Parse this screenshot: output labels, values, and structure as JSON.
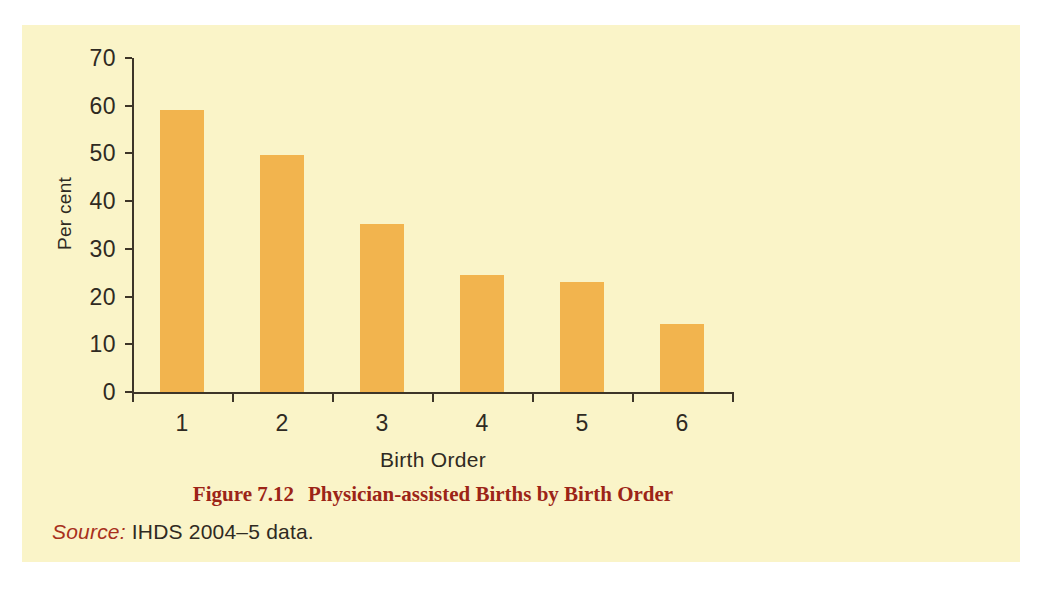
{
  "figure": {
    "caption_number": "Figure 7.12",
    "caption_title": "Physician-assisted Births by Birth Order",
    "source_label": "Source:",
    "source_text": " IHDS 2004–5 data."
  },
  "colors": {
    "panel_background": "#faf4c8",
    "bar_fill": "#f2b44e",
    "axis": "#3d3528",
    "caption": "#9c2417",
    "source_label": "#a8301c",
    "page_background": "#ffffff"
  },
  "chart_data": {
    "type": "bar",
    "title": "Physician-assisted Births by Birth Order",
    "xlabel": "Birth Order",
    "ylabel": "Per cent",
    "categories": [
      "1",
      "2",
      "3",
      "4",
      "5",
      "6"
    ],
    "values": [
      59.2,
      49.7,
      35.3,
      24.5,
      23.1,
      14.3
    ],
    "ylim": [
      0,
      70
    ],
    "yticks": [
      0,
      10,
      20,
      30,
      40,
      50,
      60,
      70
    ],
    "ytick_labels": [
      "0",
      "10",
      "20",
      "30",
      "40",
      "50",
      "60",
      "70"
    ],
    "xtick_labels": [
      "1",
      "2",
      "3",
      "4",
      "5",
      "6"
    ],
    "grid": false,
    "legend": false,
    "bar_color": "#f2b44e"
  }
}
